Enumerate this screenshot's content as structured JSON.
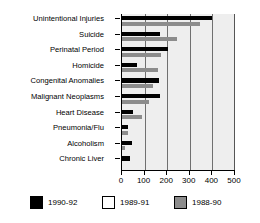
{
  "chart_data": {
    "type": "bar",
    "orientation": "horizontal",
    "title": "",
    "xlabel": "",
    "ylabel": "",
    "xlim": [
      0,
      500
    ],
    "xticks": [
      0,
      100,
      200,
      300,
      400,
      500
    ],
    "xtick_labels": [
      "0",
      "100",
      "200",
      "300",
      "400",
      "500"
    ],
    "grid": true,
    "grid_axis": "x",
    "legend_position": "bottom",
    "categories": [
      "Unintentional Injuries",
      "Suicide",
      "Perinatal Period",
      "Homicide",
      "Congenital Anomalies",
      "Malignant Neoplasms",
      "Heart Disease",
      "Pneumonia/Flu",
      "Alcoholism",
      "Chronic Liver"
    ],
    "series": [
      {
        "name": "1990-92",
        "color": "#000000",
        "values": [
          400,
          168,
          205,
          65,
          163,
          168,
          48,
          28,
          45,
          35
        ]
      },
      {
        "name": "1989-91",
        "color": "#ffffff",
        "values": [
          0,
          0,
          0,
          0,
          0,
          0,
          0,
          0,
          0,
          0
        ]
      },
      {
        "name": "1988-90",
        "color": "#8c8c8c",
        "values": [
          345,
          245,
          172,
          160,
          137,
          118,
          90,
          25,
          12,
          0
        ]
      }
    ]
  },
  "legend": {
    "items": [
      {
        "label": "1990-92",
        "color": "#000000"
      },
      {
        "label": "1989-91",
        "color": "#ffffff"
      },
      {
        "label": "1988-90",
        "color": "#8c8c8c"
      }
    ]
  }
}
